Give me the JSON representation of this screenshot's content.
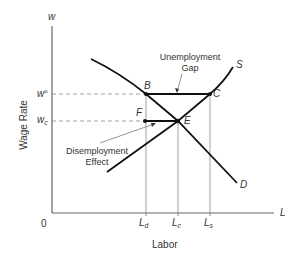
{
  "diagram": {
    "type": "labor-market-minimum-wage",
    "axes": {
      "y_symbol": "w",
      "y_title": "Wage Rate",
      "x_symbol": "L",
      "x_title": "Labor",
      "origin": "0"
    },
    "wage_ticks": [
      {
        "base": "w",
        "mark": "o",
        "kind": "sup",
        "id": "w-min"
      },
      {
        "base": "w",
        "mark": "c",
        "kind": "sub",
        "id": "w-c"
      }
    ],
    "labor_ticks": [
      {
        "base": "L",
        "mark": "d",
        "id": "L-d"
      },
      {
        "base": "L",
        "mark": "c",
        "id": "L-c"
      },
      {
        "base": "L",
        "mark": "s",
        "id": "L-s"
      }
    ],
    "curves": {
      "demand": "D",
      "supply": "S"
    },
    "points": {
      "B": "B",
      "C": "C",
      "E": "E",
      "F": "F"
    },
    "annotations": {
      "unemployment_gap_line1": "Unemployment",
      "unemployment_gap_line2": "Gap",
      "disemployment_line1": "Disemployment",
      "disemployment_line2": "Effect"
    },
    "colors": {
      "curve": "#111111",
      "axis": "#666666",
      "guide": "#888888",
      "text": "#333333"
    }
  }
}
